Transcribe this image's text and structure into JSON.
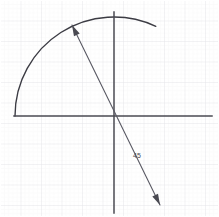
{
  "canvas": {
    "width": 219,
    "height": 217,
    "background_color": "#ffffff",
    "description": "Hand-drawn geometry sketch on graph paper"
  },
  "grid": {
    "minor_spacing": 4.1,
    "major_spacing": 20.5,
    "minor_color": "#f2f2f4",
    "major_color": "#e6e6ea",
    "minor_width": 0.6,
    "major_width": 0.9,
    "visible": true
  },
  "axes": {
    "color": "#4a4a52",
    "stroke_width": 1.5,
    "origin": {
      "x": 114,
      "y": 116
    },
    "horizontal": {
      "x1": 14,
      "y1": 116,
      "x2": 212,
      "y2": 116,
      "label": "x-axis"
    },
    "vertical": {
      "x1": 114,
      "y1": 12,
      "x2": 114,
      "y2": 213,
      "label": "y-axis"
    }
  },
  "shapes": {
    "arc": {
      "type": "circle-arc",
      "center": {
        "x": 114,
        "y": 116
      },
      "radius": 99,
      "start_angle_deg": 180,
      "end_angle_deg": 295,
      "color": "#3c3c44",
      "stroke_width": 1.4,
      "label": "circle-arc"
    },
    "ray": {
      "type": "line-with-arrowheads",
      "start": {
        "x": 72,
        "y": 25
      },
      "end": {
        "x": 160,
        "y": 205
      },
      "passes_through_origin": true,
      "color": "#5a5a64",
      "stroke_width": 1.1,
      "arrowhead_start": true,
      "arrowhead_end": true,
      "label": "diameter-ray"
    }
  },
  "annotations": [
    {
      "id": "angle-label",
      "text": "45",
      "x": 133,
      "y": 158,
      "font_size": 7,
      "color": "#4a4a52",
      "label": "angle-measure-label"
    }
  ]
}
